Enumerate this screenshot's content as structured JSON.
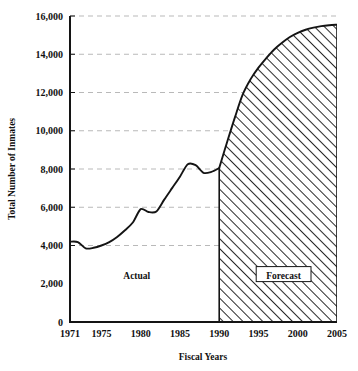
{
  "chart_data": {
    "type": "area",
    "title": "",
    "xlabel": "Fiscal Years",
    "ylabel": "Total Number of Inmates",
    "xlim": [
      1971,
      2005
    ],
    "ylim": [
      0,
      16000
    ],
    "grid": true,
    "legend": "none",
    "y_ticks": [
      "0",
      "2,000",
      "4,000",
      "6,000",
      "8,000",
      "10,000",
      "12,000",
      "14,000",
      "16,000"
    ],
    "y_tick_values": [
      0,
      2000,
      4000,
      6000,
      8000,
      10000,
      12000,
      14000,
      16000
    ],
    "x_ticks": [
      "1971",
      "1975",
      "1980",
      "1985",
      "1990",
      "1995",
      "2000",
      "2005"
    ],
    "x_tick_values": [
      1971,
      1975,
      1980,
      1985,
      1990,
      1995,
      2000,
      2005
    ],
    "annotations": [
      {
        "name": "actual-label",
        "text": "Actual",
        "x": 1979.5,
        "y": 2400,
        "boxed": false
      },
      {
        "name": "forecast-label",
        "text": "Forecast",
        "x": 1998.2,
        "y": 2400,
        "boxed": true
      }
    ],
    "series": [
      {
        "name": "Actual",
        "style": "line",
        "x": [
          1971,
          1972,
          1973,
          1974,
          1975,
          1976,
          1977,
          1978,
          1979,
          1980,
          1981,
          1982,
          1983,
          1984,
          1985,
          1986,
          1987,
          1988,
          1989,
          1990
        ],
        "values": [
          4200,
          4180,
          3850,
          3880,
          4000,
          4180,
          4450,
          4800,
          5200,
          5900,
          5750,
          5780,
          6400,
          7000,
          7600,
          8250,
          8200,
          7800,
          7850,
          8050
        ]
      },
      {
        "name": "Forecast",
        "style": "hatched-area",
        "hatch": "diagonal-45",
        "x": [
          1990,
          1991,
          1992,
          1993,
          1994,
          1995,
          1996,
          1997,
          1998,
          1999,
          2000,
          2001,
          2002,
          2003,
          2004,
          2005
        ],
        "values": [
          8050,
          9400,
          10700,
          11900,
          12700,
          13300,
          13800,
          14250,
          14600,
          14900,
          15120,
          15280,
          15390,
          15470,
          15520,
          15550
        ]
      }
    ],
    "forecast_boundary_year": 1990,
    "colors": {
      "line": "#141414",
      "axis": "#141414",
      "grid": "#b9b9b9",
      "hatch": "#2a2a2a",
      "background": "#ffffff",
      "text": "#111111"
    }
  }
}
